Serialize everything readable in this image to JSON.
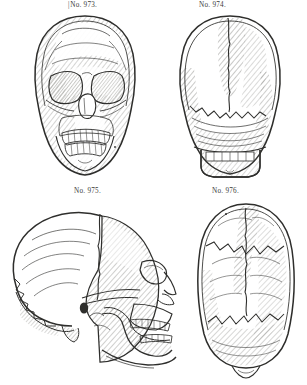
{
  "plate": {
    "title": "Plate of four engraved human skull views",
    "background_color": "#ffffff",
    "ink_color": "#2e2e2c",
    "hatch_color": "#5d5d5a",
    "width": 307,
    "height": 385
  },
  "figures": [
    {
      "id": "fig-973",
      "caption": "No. 973.",
      "leading_bracket": "|",
      "view": "anterior-frontal-skull",
      "description": "Front view of a human skull with hatched shading on the left frontal and temporal regions, orbits, nasal aperture, maxilla and mandible with teeth.",
      "caption_x": 68,
      "caption_y": 1,
      "x": 22,
      "y": 14,
      "w": 126,
      "h": 166
    },
    {
      "id": "fig-974",
      "caption": "No. 974.",
      "leading_bracket": "",
      "view": "posterior-occipital-skull",
      "description": "Rear view of a human skull showing the occipital bone, lambdoid suture, parietal bones and the mandible with teeth below.",
      "caption_x": 199,
      "caption_y": 1,
      "x": 168,
      "y": 14,
      "w": 124,
      "h": 166
    },
    {
      "id": "fig-975",
      "caption": "No. 975.",
      "leading_bracket": "",
      "view": "lateral-profile-skull",
      "description": "Left lateral view of a human skull facing right, with hatched parietal and temporal regions, zygomatic arch, maxilla and mandible with full dentition.",
      "caption_x": 74,
      "caption_y": 187,
      "x": 6,
      "y": 200,
      "w": 176,
      "h": 180
    },
    {
      "id": "fig-976",
      "caption": "No. 976.",
      "leading_bracket": "",
      "view": "superior-norma-verticalis-skull",
      "description": "Top view of a human skull showing the coronal, sagittal and lambdoid sutures with hatched shading across the parietal bones.",
      "caption_x": 212,
      "caption_y": 187,
      "x": 188,
      "y": 200,
      "w": 116,
      "h": 180
    }
  ]
}
